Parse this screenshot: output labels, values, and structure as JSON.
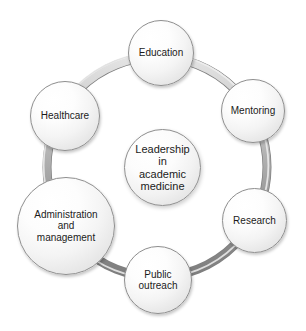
{
  "diagram": {
    "type": "circular-cycle-diagram",
    "background_color": "#ffffff",
    "ring_color": "#9a9a9a",
    "ring_highlight_color": "#dcdcdc",
    "node_outline_color": "#8e8e8e",
    "text_color": "#1b1b1b",
    "center": {
      "label": "Leadership\nin\nacademic\nmedicine",
      "font_size": 11
    },
    "nodes": [
      {
        "id": "education",
        "label": "Education",
        "font_size": 10
      },
      {
        "id": "mentoring",
        "label": "Mentoring",
        "font_size": 10
      },
      {
        "id": "research",
        "label": "Research",
        "font_size": 10
      },
      {
        "id": "public-outreach",
        "label": "Public\noutreach",
        "font_size": 10
      },
      {
        "id": "administration-and-management",
        "label": "Administration\nand\nmanagement",
        "font_size": 10
      },
      {
        "id": "healthcare",
        "label": "Healthcare",
        "font_size": 10
      }
    ]
  }
}
